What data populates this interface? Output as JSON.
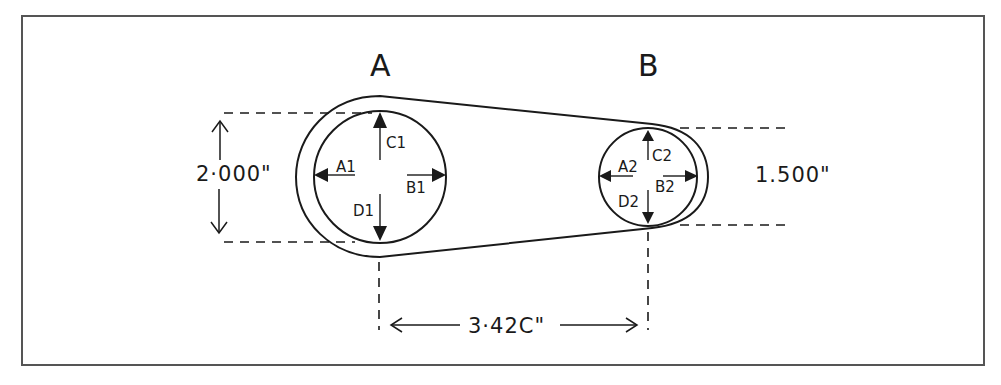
{
  "diagram": {
    "pulleys": [
      {
        "id": "A",
        "label": "A",
        "diameter_label": "2·000\"",
        "diameter_in": 2.0,
        "points": {
          "left": "A1",
          "right": "B1",
          "top": "C1",
          "bottom": "D1"
        }
      },
      {
        "id": "B",
        "label": "B",
        "diameter_label": "1.500\"",
        "diameter_in": 1.5,
        "points": {
          "left": "A2",
          "right": "B2",
          "top": "C2",
          "bottom": "D2"
        }
      }
    ],
    "center_distance_label": "3·42C\"",
    "center_distance_in": 3.42,
    "colors": {
      "line": "#1a1a1a",
      "frame": "#555555",
      "background": "#ffffff"
    }
  }
}
